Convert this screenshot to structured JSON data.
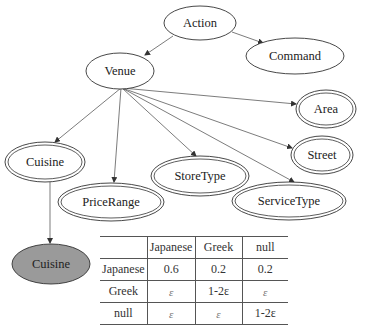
{
  "diagram": {
    "type": "bayesian-network",
    "nodes": [
      {
        "id": "action",
        "label": "Action",
        "style": "single"
      },
      {
        "id": "command",
        "label": "Command",
        "style": "single"
      },
      {
        "id": "venue",
        "label": "Venue",
        "style": "single"
      },
      {
        "id": "area",
        "label": "Area",
        "style": "double"
      },
      {
        "id": "street",
        "label": "Street",
        "style": "double"
      },
      {
        "id": "cuisine",
        "label": "Cuisine",
        "style": "double"
      },
      {
        "id": "storetype",
        "label": "StoreType",
        "style": "double"
      },
      {
        "id": "pricerange",
        "label": "PriceRange",
        "style": "double"
      },
      {
        "id": "servicetype",
        "label": "ServiceType",
        "style": "double"
      },
      {
        "id": "cuisine_obs",
        "label": "Cuisine",
        "style": "filled"
      }
    ],
    "edges": [
      {
        "from": "action",
        "to": "venue"
      },
      {
        "from": "action",
        "to": "command"
      },
      {
        "from": "venue",
        "to": "area"
      },
      {
        "from": "venue",
        "to": "street"
      },
      {
        "from": "venue",
        "to": "cuisine"
      },
      {
        "from": "venue",
        "to": "pricerange"
      },
      {
        "from": "venue",
        "to": "storetype"
      },
      {
        "from": "venue",
        "to": "servicetype"
      },
      {
        "from": "cuisine",
        "to": "cuisine_obs"
      }
    ]
  },
  "table": {
    "headers": [
      "",
      "Japanese",
      "Greek",
      "null"
    ],
    "rows": [
      {
        "label": "Japanese",
        "cells": [
          "0.6",
          "0.2",
          "0.2"
        ]
      },
      {
        "label": "Greek",
        "cells": [
          "ε",
          "1-2ε",
          "ε"
        ]
      },
      {
        "label": "null",
        "cells": [
          "ε",
          "ε",
          "1-2ε"
        ]
      }
    ]
  }
}
